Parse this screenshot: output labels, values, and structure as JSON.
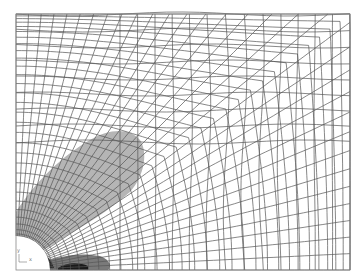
{
  "figure": {
    "type": "finite-element-mesh",
    "colors": {
      "background": "#ffffff",
      "mesh": "#555555",
      "zone_light": "#b5b5b5",
      "zone_mid": "#7a7a7a",
      "zone_dark": "#1a1a1a",
      "hole": "#ffffff"
    },
    "zones": [
      {
        "name": "plastic-zone-lobe",
        "shade": "light"
      },
      {
        "name": "plastic-zone-lower",
        "shade": "mid"
      },
      {
        "name": "plastic-zone-core",
        "shade": "dark"
      }
    ],
    "triad": {
      "x_label": "x",
      "y_label": "y"
    }
  }
}
